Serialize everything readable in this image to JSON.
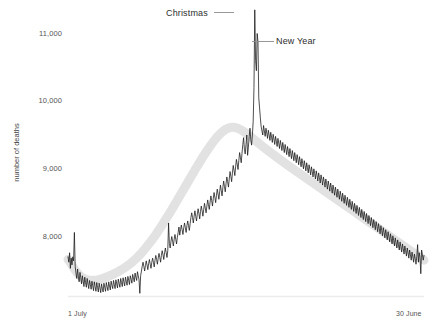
{
  "chart_data": {
    "type": "line",
    "title": "",
    "xlabel": "",
    "ylabel": "number of deaths",
    "x_tick_labels": [
      "1 July",
      "30 June"
    ],
    "y_tick_labels": [
      "8,000",
      "9,000",
      "10,000",
      "11,000"
    ],
    "y_tick_values": [
      8000,
      9000,
      10000,
      11000
    ],
    "ylim": [
      7100,
      11500
    ],
    "xlim": [
      0,
      364
    ],
    "grid": false,
    "legend": "none",
    "annotations": [
      {
        "label": "Christmas",
        "value": 11350,
        "note": "tall spike, late December"
      },
      {
        "label": "New Year",
        "value": 10880,
        "note": "second spike, 1 January"
      }
    ],
    "series": [
      {
        "name": "smoothed trend",
        "style": "thick light grey band",
        "color": "#e2e2e2",
        "values": [
          7660,
          7640,
          7610,
          7580,
          7550,
          7520,
          7495,
          7470,
          7450,
          7430,
          7412,
          7398,
          7386,
          7376,
          7368,
          7362,
          7358,
          7355,
          7353,
          7352,
          7352,
          7353,
          7355,
          7358,
          7362,
          7366,
          7371,
          7377,
          7383,
          7390,
          7397,
          7404,
          7412,
          7420,
          7428,
          7437,
          7446,
          7455,
          7464,
          7474,
          7484,
          7494,
          7505,
          7516,
          7528,
          7540,
          7553,
          7566,
          7580,
          7594,
          7609,
          7625,
          7641,
          7658,
          7676,
          7694,
          7713,
          7733,
          7753,
          7774,
          7796,
          7818,
          7841,
          7864,
          7888,
          7912,
          7937,
          7962,
          7988,
          8014,
          8041,
          8068,
          8096,
          8124,
          8152,
          8181,
          8210,
          8240,
          8270,
          8300,
          8330,
          8361,
          8392,
          8423,
          8454,
          8486,
          8517,
          8549,
          8581,
          8613,
          8645,
          8677,
          8709,
          8741,
          8773,
          8805,
          8837,
          8869,
          8901,
          8933,
          8964,
          8996,
          9027,
          9058,
          9089,
          9119,
          9149,
          9179,
          9208,
          9237,
          9265,
          9293,
          9320,
          9347,
          9373,
          9398,
          9422,
          9445,
          9467,
          9488,
          9508,
          9526,
          9543,
          9558,
          9572,
          9584,
          9594,
          9602,
          9608,
          9612,
          9614,
          9614,
          9612,
          9608,
          9602,
          9595,
          9586,
          9576,
          9565,
          9553,
          9540,
          9527,
          9513,
          9499,
          9484,
          9469,
          9454,
          9439,
          9424,
          9409,
          9394,
          9379,
          9364,
          9349,
          9334,
          9319,
          9305,
          9290,
          9276,
          9261,
          9247,
          9233,
          9219,
          9205,
          9191,
          9177,
          9163,
          9149,
          9136,
          9122,
          9109,
          9095,
          9082,
          9068,
          9055,
          9042,
          9028,
          9015,
          9002,
          8989,
          8976,
          8963,
          8950,
          8937,
          8924,
          8911,
          8898,
          8885,
          8872,
          8859,
          8846,
          8833,
          8820,
          8807,
          8794,
          8781,
          8768,
          8755,
          8742,
          8729,
          8716,
          8703,
          8690,
          8677,
          8664,
          8651,
          8638,
          8625,
          8612,
          8599,
          8586,
          8573,
          8560,
          8547,
          8534,
          8521,
          8508,
          8495,
          8482,
          8469,
          8456,
          8443,
          8430,
          8417,
          8404,
          8391,
          8378,
          8365,
          8352,
          8339,
          8326,
          8313,
          8300,
          8287,
          8274,
          8261,
          8248,
          8235,
          8222,
          8209,
          8196,
          8183,
          8170,
          8157,
          8144,
          8131,
          8118,
          8105,
          8092,
          8079,
          8066,
          8053,
          8040,
          8027,
          8014,
          8001,
          7988,
          7975,
          7962,
          7949,
          7936,
          7923,
          7910,
          7897,
          7884,
          7871,
          7858,
          7845,
          7832,
          7819,
          7806,
          7793,
          7780,
          7767,
          7754,
          7741,
          7728,
          7715,
          7702,
          7689,
          7676,
          7663,
          7650
        ]
      },
      {
        "name": "daily deaths",
        "style": "thin jagged black line",
        "color": "#141414",
        "note": "daily observed counts with weekday noise; Christmas and New Year spikes",
        "values": [
          7700,
          7620,
          7760,
          7530,
          7680,
          7580,
          7700,
          7640,
          8060,
          7560,
          7460,
          7380,
          7520,
          7400,
          7330,
          7470,
          7390,
          7300,
          7420,
          7340,
          7260,
          7400,
          7320,
          7250,
          7380,
          7300,
          7230,
          7350,
          7290,
          7220,
          7340,
          7270,
          7200,
          7330,
          7260,
          7190,
          7320,
          7250,
          7180,
          7310,
          7240,
          7170,
          7300,
          7235,
          7180,
          7310,
          7250,
          7190,
          7320,
          7260,
          7200,
          7330,
          7270,
          7210,
          7340,
          7280,
          7230,
          7350,
          7290,
          7230,
          7360,
          7300,
          7240,
          7370,
          7310,
          7250,
          7380,
          7320,
          7260,
          7390,
          7330,
          7270,
          7400,
          7340,
          7280,
          7410,
          7355,
          7290,
          7420,
          7370,
          7310,
          7440,
          7390,
          7330,
          7460,
          7400,
          7350,
          7480,
          7420,
          7360,
          7160,
          7420,
          7490,
          7560,
          7620,
          7560,
          7490,
          7570,
          7640,
          7580,
          7510,
          7600,
          7660,
          7590,
          7530,
          7620,
          7680,
          7620,
          7550,
          7650,
          7720,
          7660,
          7590,
          7680,
          7750,
          7690,
          7620,
          7720,
          7790,
          7730,
          7660,
          7760,
          7830,
          7760,
          7690,
          7790,
          8200,
          7900,
          7830,
          7930,
          8000,
          7930,
          7860,
          7960,
          8030,
          7960,
          7890,
          7990,
          8060,
          8140,
          8020,
          8100,
          8170,
          8100,
          8030,
          8130,
          8200,
          8130,
          8060,
          8160,
          8230,
          8160,
          8090,
          8190,
          8280,
          8350,
          8280,
          8200,
          8300,
          8380,
          8300,
          8230,
          8330,
          8410,
          8340,
          8260,
          8370,
          8450,
          8380,
          8300,
          8400,
          8490,
          8420,
          8350,
          8450,
          8540,
          8470,
          8400,
          8510,
          8600,
          8530,
          8450,
          8560,
          8650,
          8580,
          8500,
          8610,
          8700,
          8630,
          8550,
          8660,
          8760,
          8680,
          8600,
          8720,
          8820,
          8740,
          8660,
          8780,
          8880,
          8810,
          8730,
          8850,
          8960,
          8890,
          8810,
          8940,
          9050,
          8980,
          8900,
          9030,
          9140,
          9070,
          8990,
          9120,
          9240,
          9170,
          9090,
          9230,
          9360,
          9460,
          9290,
          9220,
          9360,
          9500,
          9200,
          9320,
          9480,
          9600,
          9430,
          9350,
          9500,
          9700,
          10200,
          11350,
          10600,
          10450,
          11000,
          10880,
          10050,
          9900,
          9750,
          9620,
          9560,
          9500,
          9640,
          9560,
          9480,
          9600,
          9530,
          9450,
          9570,
          9500,
          9420,
          9540,
          9470,
          9390,
          9510,
          9440,
          9360,
          9480,
          9410,
          9330,
          9450,
          9380,
          9300,
          9420,
          9350,
          9270,
          9390,
          9320,
          9240,
          9360,
          9290,
          9210,
          9330,
          9260,
          9180,
          9300,
          9230,
          9150,
          9270,
          9200,
          9120,
          9240,
          9170,
          9090,
          9210,
          9140,
          9060,
          9180,
          9110,
          9030,
          9150,
          9080,
          9000,
          9120,
          9050,
          8970,
          9090,
          9020,
          8940,
          9060,
          8990,
          8910,
          9030,
          8960,
          8880,
          9000,
          8930,
          8850,
          8970,
          8900,
          8820,
          8940,
          8870,
          8790,
          8910,
          8840,
          8760,
          8880,
          8810,
          8730,
          8850,
          8780,
          8700,
          8820,
          8750,
          8670,
          8790,
          8720,
          8640,
          8760,
          8690,
          8610,
          8730,
          8660,
          8580,
          8700,
          8630,
          8550,
          8670,
          8600,
          8520,
          8640,
          8570,
          8490,
          8610,
          8540,
          8460,
          8580,
          8510,
          8430,
          8550,
          8480,
          8400,
          8520,
          8450,
          8370,
          8490,
          8420,
          8340,
          8460,
          8390,
          8310,
          8430,
          8360,
          8280,
          8400,
          8330,
          8250,
          8370,
          8300,
          8220,
          8340,
          8270,
          8190,
          8310,
          8240,
          8160,
          8280,
          8210,
          8130,
          8250,
          8180,
          8100,
          8220,
          8150,
          8070,
          8190,
          8120,
          8040,
          8160,
          8090,
          8010,
          8130,
          8060,
          7980,
          8100,
          8030,
          7950,
          8070,
          8000,
          7920,
          8040,
          7970,
          7890,
          8010,
          7940,
          7860,
          7980,
          7910,
          7830,
          7950,
          7880,
          7800,
          7920,
          7850,
          7770,
          7890,
          7820,
          7740,
          7860,
          7790,
          7710,
          7830,
          7760,
          7680,
          7800,
          7730,
          7650,
          7770,
          7700,
          7620,
          7740,
          7670,
          7590,
          7710,
          7880,
          7620,
          7760,
          7690,
          7450,
          7800,
          7730,
          7650,
          7720
        ]
      }
    ]
  },
  "axes": {
    "y_title": "number of deaths",
    "x_start_label": "1 July",
    "x_end_label": "30 June"
  },
  "annotations": {
    "christmas": "Christmas",
    "new_year": "New Year"
  },
  "colors": {
    "line": "#141414",
    "trend_band": "#e3e3e3",
    "axis": "#e8e8e8",
    "text": "#555555"
  }
}
